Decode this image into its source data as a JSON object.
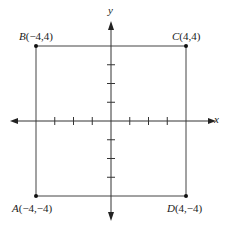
{
  "diagram": {
    "type": "coordinate-plane-square",
    "axes": {
      "x_label": "x",
      "y_label": "y",
      "tick_values": [
        -3,
        -2,
        -1,
        1,
        2,
        3
      ]
    },
    "points": [
      {
        "name": "B",
        "coords": "(−4,4)",
        "x": -4,
        "y": 4
      },
      {
        "name": "C",
        "coords": "(4,4)",
        "x": 4,
        "y": 4
      },
      {
        "name": "A",
        "coords": "(−4,−4)",
        "x": -4,
        "y": -4
      },
      {
        "name": "D",
        "coords": "(4,−4)",
        "x": 4,
        "y": -4
      }
    ],
    "colors": {
      "line": "#333333",
      "background": "#ffffff"
    }
  }
}
